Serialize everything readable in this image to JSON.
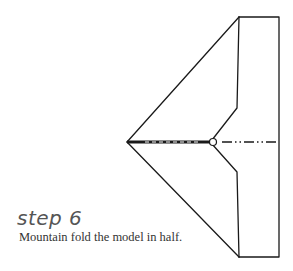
{
  "step": {
    "label": "step 6"
  },
  "instruction": {
    "text": "Mountain fold the model in half."
  },
  "diagram": {
    "line_color": "#1a1a1a",
    "fold_line": "mountain (dash-dot-dot)"
  }
}
